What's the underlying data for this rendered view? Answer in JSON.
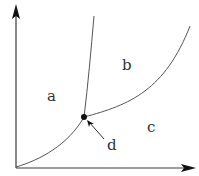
{
  "diagram": {
    "type": "phase-diagram",
    "colors": {
      "axis": "#3a3a3a",
      "curve": "#555555",
      "point": "#111111",
      "text": "#333333",
      "background": "#ffffff"
    },
    "regions": {
      "a": "a",
      "b": "b",
      "c": "c"
    },
    "point_label": "d"
  }
}
